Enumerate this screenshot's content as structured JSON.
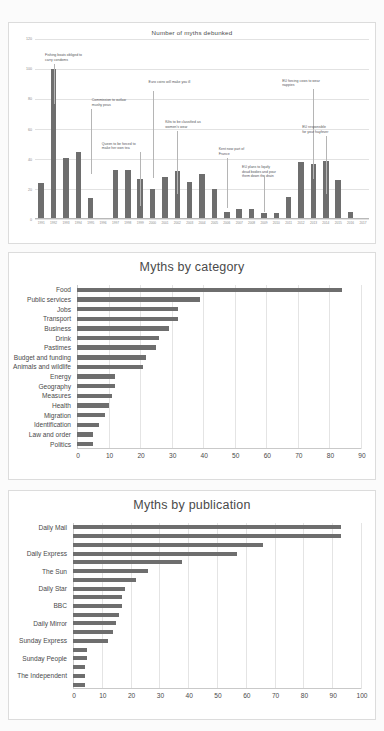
{
  "chart_data": [
    {
      "type": "bar",
      "title": "Number of myths debunked",
      "xlabel": "",
      "ylabel": "",
      "ylim": [
        0,
        120
      ],
      "yticks": [
        0,
        20,
        40,
        60,
        80,
        100,
        120
      ],
      "grid": true,
      "legend": "none",
      "categories": [
        "1991",
        "1992",
        "1993",
        "1994",
        "1995",
        "1996",
        "1997",
        "1998",
        "1999",
        "2000",
        "2001",
        "2002",
        "2003",
        "2004",
        "2005",
        "2006",
        "2007",
        "2008",
        "2009",
        "2010",
        "2011",
        "2012",
        "2013",
        "2014",
        "2015",
        "2016",
        "2017"
      ],
      "values": [
        24,
        100,
        41,
        45,
        14,
        1,
        33,
        33,
        27,
        20,
        28,
        32,
        25,
        30,
        20,
        5,
        7,
        7,
        4,
        4,
        15,
        38,
        37,
        39,
        26,
        5,
        0
      ],
      "annotations": [
        {
          "label": "Fishing boats obliged to\ncarry condoms",
          "category": "1992"
        },
        {
          "label": "Commission to outlaw\nmushy peas",
          "category": "1995"
        },
        {
          "label": "Queen to be forced to\nmake her own tea",
          "category": "1999"
        },
        {
          "label": "Euro coins will make you ill",
          "category": "2000"
        },
        {
          "label": "Kilts to be classified as\nwomen's wear",
          "category": "2002"
        },
        {
          "label": "Kent now part of\nFrance",
          "category": "2006"
        },
        {
          "label": "EU plans to liquify\ndead bodies and pour\nthem down the drain",
          "category": "2009"
        },
        {
          "label": "EU forcing cows to wear\nnappies",
          "category": "2013"
        },
        {
          "label": "EU responsible\nfor your hayfever",
          "category": "2014"
        }
      ]
    },
    {
      "type": "bar",
      "orientation": "horizontal",
      "title": "Myths by category",
      "xlabel": "",
      "ylabel": "",
      "xlim": [
        0,
        90
      ],
      "xticks": [
        0,
        10,
        20,
        30,
        40,
        50,
        60,
        70,
        80,
        90
      ],
      "grid": true,
      "legend": "none",
      "categories": [
        "Politics",
        "Law and order",
        "Identification",
        "Migration",
        "Health",
        "Measures",
        "Geography",
        "Energy",
        "Animals and wildlife",
        "Budget and funding",
        "Pastimes",
        "Drink",
        "Business",
        "Transport",
        "Jobs",
        "Public services",
        "Food"
      ],
      "values": [
        5,
        5,
        7,
        9,
        10,
        11,
        12,
        12,
        21,
        22,
        25,
        26,
        29,
        32,
        32,
        39,
        84
      ]
    },
    {
      "type": "bar",
      "orientation": "horizontal",
      "title": "Myths by publication",
      "xlabel": "",
      "ylabel": "",
      "xlim": [
        0,
        100
      ],
      "xticks": [
        0,
        10,
        20,
        30,
        40,
        50,
        60,
        70,
        80,
        90,
        100
      ],
      "grid": true,
      "legend": "none",
      "categories": [
        "",
        "The Independent",
        "",
        "Sunday People",
        "",
        "Sunday Express",
        "",
        "Daily Mirror",
        "",
        "BBC",
        "",
        "Daily Star",
        "",
        "The Sun",
        "",
        "Daily Express",
        "",
        "",
        "Daily Mail"
      ],
      "visible_labels": [
        "The Independent",
        "Sunday People",
        "Sunday Express",
        "Daily Mirror",
        "BBC",
        "Daily Star",
        "The Sun",
        "Daily Express",
        "Daily Mail"
      ],
      "values": [
        4,
        4,
        4,
        5,
        5,
        12,
        14,
        15,
        16,
        17,
        17,
        18,
        22,
        26,
        38,
        57,
        66,
        93,
        93
      ]
    }
  ],
  "colors": {
    "bar": "#6e6e6e",
    "grid": "#e2e2e2",
    "axis": "#c9c9c9",
    "text": "#4a4a4a",
    "callout": "#55565a",
    "panel_bg": "#ffffff",
    "page_bg": "#fbfbfb",
    "panel_border": "#dcdcdc"
  }
}
